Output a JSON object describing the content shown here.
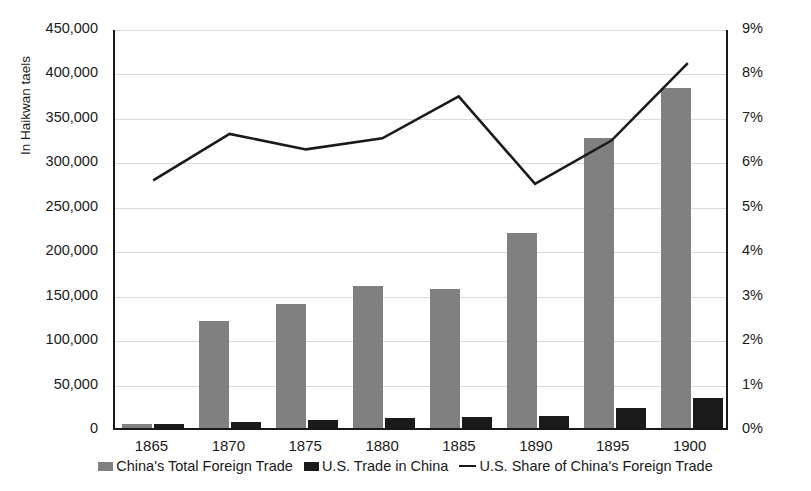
{
  "chart_data": {
    "type": "bar",
    "title": "",
    "xlabel": "",
    "ylabel": "In Haikwan taels",
    "y2label": "",
    "categories": [
      "1865",
      "1870",
      "1875",
      "1880",
      "1885",
      "1890",
      "1895",
      "1900"
    ],
    "ylim": [
      0,
      450000
    ],
    "y2lim": [
      0,
      0.09
    ],
    "ytick_labels": [
      "450,000",
      "400,000",
      "350,000",
      "300,000",
      "250,000",
      "200,000",
      "150,000",
      "100,000",
      "50,000",
      "0"
    ],
    "ytick_values": [
      450000,
      400000,
      350000,
      300000,
      250000,
      200000,
      150000,
      100000,
      50000,
      0
    ],
    "y2tick_labels": [
      "9%",
      "8%",
      "7%",
      "6%",
      "5%",
      "4%",
      "3%",
      "2%",
      "1%",
      "0%"
    ],
    "y2tick_values": [
      9,
      8,
      7,
      6,
      5,
      4,
      3,
      2,
      1,
      0
    ],
    "grid": true,
    "legend_position": "bottom",
    "series": [
      {
        "name": "China's Total Foreign Trade",
        "type": "bar",
        "axis": "left",
        "color": "#808080",
        "values": [
          4000,
          120000,
          140000,
          160000,
          156000,
          219000,
          326000,
          383000
        ]
      },
      {
        "name": "U.S. Trade in China",
        "type": "bar",
        "axis": "left",
        "color": "#1a1a1a",
        "values": [
          4000,
          7000,
          8500,
          11000,
          12500,
          13000,
          23000,
          33500
        ]
      },
      {
        "name": "U.S. Share of China's Foreign Trade",
        "type": "line",
        "axis": "right",
        "color": "#1a1a1a",
        "values": [
          5.6,
          6.65,
          6.3,
          6.55,
          7.5,
          5.52,
          6.5,
          8.25
        ]
      }
    ]
  },
  "legend": {
    "items": [
      {
        "label": "China's Total Foreign Trade",
        "marker": "square-gray"
      },
      {
        "label": "U.S. Trade in China",
        "marker": "square-black"
      },
      {
        "label": "U.S. Share of China's Foreign Trade",
        "marker": "line-black"
      }
    ]
  },
  "colors": {
    "total_trade": "#808080",
    "us_trade": "#1a1a1a",
    "us_share_line": "#1a1a1a",
    "gridline": "#d9d9d9",
    "axis": "#1a1a1a",
    "background": "#ffffff"
  }
}
